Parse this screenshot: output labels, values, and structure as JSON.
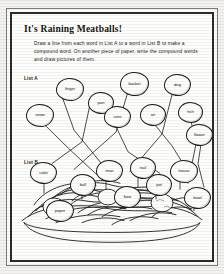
{
  "page": {
    "title": "It's Raining Meatballs!",
    "instructions": "Draw a line from each word in List A to a word in List B to make a compound word. On another piece of paper, write the compound words and draw pictures of them."
  },
  "lists": {
    "a_label": "List A",
    "b_label": "List B",
    "list_a": [
      {
        "word": "finger",
        "x": 55,
        "y": 74,
        "w": 26,
        "h": 21
      },
      {
        "word": "pan",
        "x": 88,
        "y": 88,
        "w": 24,
        "h": 20
      },
      {
        "word": "basket",
        "x": 131,
        "y": 68,
        "w": 27,
        "h": 22
      },
      {
        "word": "dog",
        "x": 182,
        "y": 70,
        "w": 25,
        "h": 20
      },
      {
        "word": "snow",
        "x": 26,
        "y": 102,
        "w": 26,
        "h": 21
      },
      {
        "word": "corn",
        "x": 112,
        "y": 103,
        "w": 25,
        "h": 20
      },
      {
        "word": "air",
        "x": 152,
        "y": 100,
        "w": 24,
        "h": 20
      },
      {
        "word": "fish",
        "x": 200,
        "y": 100,
        "w": 23,
        "h": 19
      },
      {
        "word": "flower",
        "x": 216,
        "y": 124,
        "w": 25,
        "h": 20
      }
    ],
    "list_b": [
      {
        "word": "cake",
        "x": 35,
        "y": 160,
        "w": 25,
        "h": 20
      },
      {
        "word": "ball",
        "x": 79,
        "y": 172,
        "w": 24,
        "h": 20
      },
      {
        "word": "man",
        "x": 105,
        "y": 158,
        "w": 25,
        "h": 20
      },
      {
        "word": "nail",
        "x": 142,
        "y": 155,
        "w": 24,
        "h": 20
      },
      {
        "word": "house",
        "x": 190,
        "y": 158,
        "w": 26,
        "h": 21
      },
      {
        "word": "pot",
        "x": 163,
        "y": 172,
        "w": 24,
        "h": 20
      },
      {
        "word": "bow",
        "x": 125,
        "y": 185,
        "w": 25,
        "h": 20
      },
      {
        "word": "bowl",
        "x": 208,
        "y": 186,
        "w": 25,
        "h": 20
      },
      {
        "word": "paper",
        "x": 53,
        "y": 198,
        "w": 26,
        "h": 20
      }
    ]
  },
  "colors": {
    "ink": "#1d1d18",
    "page": "#fdfdfb",
    "frame": "#2b2b28"
  },
  "illustration": {
    "name": "plate-of-spaghetti-and-meatballs"
  }
}
